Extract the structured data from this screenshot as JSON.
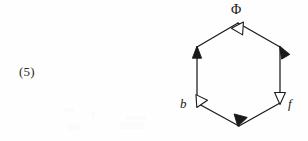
{
  "figure": {
    "equation_number": "(5)",
    "type": "hexagonal-commutative-diagram",
    "background_color": "#fefefe",
    "stroke_color": "#1a1a1a",
    "labels": {
      "top": "Φ",
      "left_lower": "b",
      "right_lower": "f"
    },
    "vertices": [
      {
        "name": "top",
        "x": 238,
        "y": 23,
        "label": "Φ"
      },
      {
        "name": "upper-right",
        "x": 280,
        "y": 47,
        "label": ""
      },
      {
        "name": "lower-right",
        "x": 280,
        "y": 103,
        "label": "f"
      },
      {
        "name": "bottom",
        "x": 239,
        "y": 126,
        "label": ""
      },
      {
        "name": "lower-left",
        "x": 197,
        "y": 103,
        "label": "b"
      },
      {
        "name": "upper-left",
        "x": 197,
        "y": 47,
        "label": ""
      }
    ],
    "edges": [
      {
        "name": "left-vertical",
        "from": "lower-left",
        "to": "upper-left",
        "arrowhead": "solid",
        "arrow_at": "upper-left"
      },
      {
        "name": "upper-left-diagonal",
        "from": "upper-left",
        "to": "top",
        "arrowhead": "hollow",
        "arrow_at": "top"
      },
      {
        "name": "upper-right-diagonal",
        "from": "top",
        "to": "upper-right",
        "arrowhead": "solid",
        "arrow_at": "upper-right"
      },
      {
        "name": "right-vertical",
        "from": "upper-right",
        "to": "lower-right",
        "arrowhead": "hollow",
        "arrow_at": "lower-right"
      },
      {
        "name": "lower-right-diagonal",
        "from": "lower-right",
        "to": "bottom",
        "arrowhead": "solid",
        "arrow_at": "bottom"
      },
      {
        "name": "lower-left-diagonal",
        "from": "bottom",
        "to": "lower-left",
        "arrowhead": "hollow",
        "arrow_at": "lower-left"
      }
    ]
  }
}
